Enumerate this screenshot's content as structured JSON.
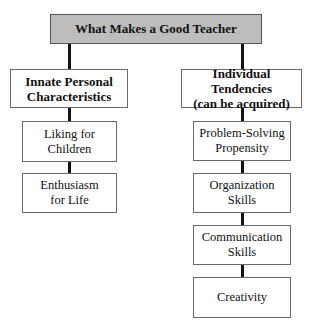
{
  "diagram": {
    "type": "hierarchy",
    "root": {
      "label": "What Makes a Good Teacher",
      "fill": "#bdbdbd"
    },
    "branches": [
      {
        "label_line1": "Innate Personal",
        "label_line2": "Characteristics",
        "children": [
          {
            "line1": "Liking for",
            "line2": "Children"
          },
          {
            "line1": "Enthusiasm",
            "line2": "for Life"
          }
        ]
      },
      {
        "label_line1": "Individual Tendencies",
        "label_line2": "(can be acquired)",
        "children": [
          {
            "line1": "Problem-Solving",
            "line2": "Propensity"
          },
          {
            "line1": "Organization",
            "line2": "Skills"
          },
          {
            "line1": "Communication",
            "line2": "Skills"
          },
          {
            "line1": "Creativity",
            "line2": ""
          }
        ]
      }
    ]
  }
}
